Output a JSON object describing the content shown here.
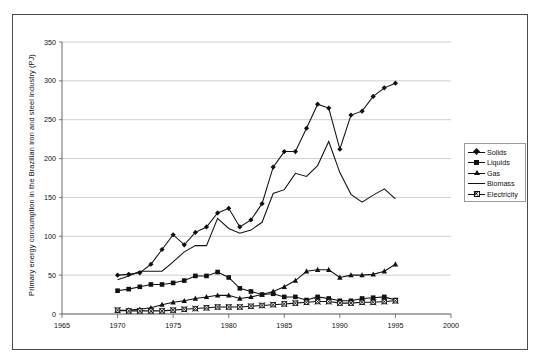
{
  "figure": {
    "frame_color": "#4a4a4a",
    "background": "#ffffff",
    "plot_line_color": "#111111",
    "gridline_color": "#c8c8c8"
  },
  "legend": {
    "position": "right",
    "entries": [
      {
        "label": "Solids",
        "marker": "diamond"
      },
      {
        "label": "Liquids",
        "marker": "square"
      },
      {
        "label": "Gas",
        "marker": "triangle"
      },
      {
        "label": "Biomass",
        "marker": "none"
      },
      {
        "label": "Electricity",
        "marker": "x-square"
      }
    ]
  },
  "chart_data": {
    "type": "line",
    "title": "",
    "xlabel": "",
    "ylabel": "Primary energy consumption in the Brazilian iron and steel industry (PJ)",
    "xlim": [
      1965,
      2000
    ],
    "ylim": [
      0,
      350
    ],
    "xticks": [
      1965,
      1970,
      1975,
      1980,
      1985,
      1990,
      1995,
      2000
    ],
    "yticks": [
      0,
      50,
      100,
      150,
      200,
      250,
      300,
      350
    ],
    "grid": "horizontal",
    "legend_position": "right",
    "x": [
      1970,
      1971,
      1972,
      1973,
      1974,
      1975,
      1976,
      1977,
      1978,
      1979,
      1980,
      1981,
      1982,
      1983,
      1984,
      1985,
      1986,
      1987,
      1988,
      1989,
      1990,
      1991,
      1992,
      1993,
      1994,
      1995
    ],
    "series": [
      {
        "name": "Solids",
        "marker": "diamond",
        "values": [
          50,
          51,
          53,
          64,
          83,
          102,
          89,
          105,
          112,
          130,
          136,
          112,
          121,
          142,
          189,
          209,
          209,
          239,
          270,
          265,
          212,
          256,
          261,
          280,
          291,
          297
        ]
      },
      {
        "name": "Liquids",
        "marker": "square",
        "values": [
          30,
          32,
          35,
          38,
          38,
          40,
          43,
          49,
          49,
          54,
          47,
          33,
          29,
          25,
          26,
          22,
          22,
          18,
          22,
          20,
          17,
          17,
          20,
          21,
          22,
          18
        ]
      },
      {
        "name": "Gas",
        "marker": "triangle",
        "values": [
          4,
          5,
          6,
          8,
          12,
          15,
          17,
          20,
          22,
          24,
          24,
          20,
          22,
          25,
          29,
          35,
          43,
          55,
          57,
          57,
          47,
          50,
          50,
          51,
          55,
          64
        ]
      },
      {
        "name": "Biomass",
        "marker": "none",
        "values": [
          44,
          49,
          55,
          55,
          55,
          67,
          80,
          88,
          88,
          123,
          110,
          104,
          108,
          118,
          155,
          160,
          181,
          177,
          191,
          222,
          182,
          154,
          144,
          153,
          161,
          148
        ]
      },
      {
        "name": "Electricity",
        "marker": "x-square",
        "values": [
          5,
          4,
          4,
          4,
          4,
          5,
          6,
          7,
          8,
          9,
          9,
          9,
          10,
          11,
          12,
          13,
          14,
          15,
          16,
          16,
          14,
          14,
          15,
          15,
          16,
          17
        ]
      }
    ]
  }
}
